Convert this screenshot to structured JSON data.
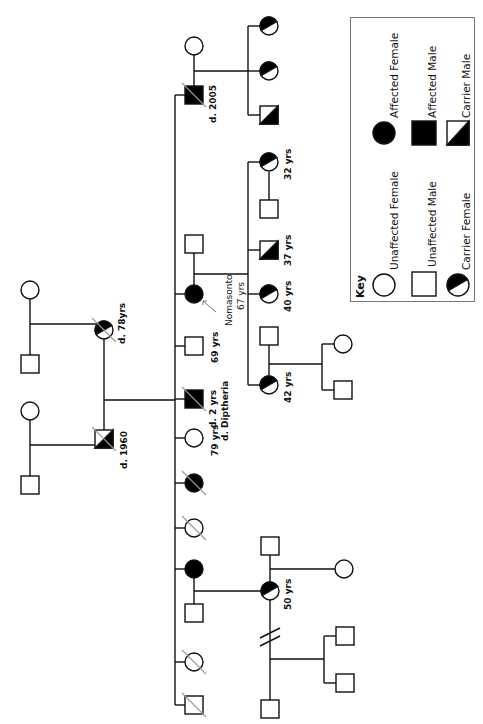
{
  "diagram": {
    "type": "pedigree",
    "orientation": "rotated-90-clockwise",
    "colors": {
      "line": "#111111",
      "fill_affected": "#000000",
      "fill_unaffected": "#ffffff",
      "deceased_slash": "#999999",
      "key_border": "#777777"
    }
  },
  "key": {
    "title": "Key",
    "items": [
      {
        "symbol": "circle-empty",
        "label": "Unaffected Female"
      },
      {
        "symbol": "square-empty",
        "label": "Unaffected Male"
      },
      {
        "symbol": "circle-half",
        "label": "Carrier Female"
      },
      {
        "symbol": "circle-filled",
        "label": "Affected Female"
      },
      {
        "symbol": "square-filled",
        "label": "Affected Male"
      },
      {
        "symbol": "square-half",
        "label": "Carrier Male"
      }
    ]
  },
  "labels": {
    "paternal_grandmother": "d. 78yrs",
    "paternal_grandfather": "d. 1960",
    "son_affected": "d. 2005",
    "sib_affected_male_age": "d. 2 yrs",
    "sib_affected_male_cause": "d. Diptheria",
    "sib_unaffected_female": "79 yrs",
    "sib_unaffected_male": "69 yrs",
    "proband_name": "Nomasonto",
    "proband_age": "67 yrs",
    "child_42": "42 yrs",
    "child_40": "40 yrs",
    "child_37": "37 yrs",
    "child_32": "32 yrs",
    "niece_50": "50 yrs"
  }
}
